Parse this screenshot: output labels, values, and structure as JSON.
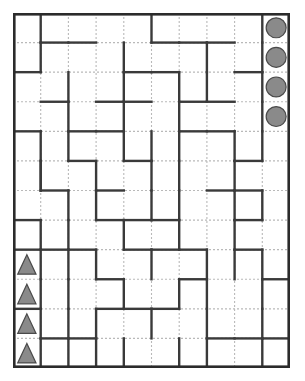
{
  "puzzle": {
    "type": "maze-grid",
    "title": "Grid Maze Puzzle",
    "grid": {
      "columns": 10,
      "rows": 12,
      "origin_x": 13,
      "origin_y": 13,
      "width": 277,
      "height": 355,
      "cell_width": 27.7,
      "cell_height": 29.583
    },
    "colors": {
      "background": "#ffffff",
      "wall": "#3a3a3a",
      "gridline": "#b9b9b9",
      "border": "#2b2b2b",
      "token_fill": "#8a8a8a",
      "token_stroke": "#4a4a4a"
    },
    "style": {
      "wall_width": 2.4,
      "border_width": 2.6,
      "gridline_width": 1.1,
      "gridline_dash": "2,2"
    },
    "tokens": [
      {
        "name": "circle-token-1",
        "shape": "circle",
        "col": 10,
        "row": 1
      },
      {
        "name": "circle-token-2",
        "shape": "circle",
        "col": 10,
        "row": 2
      },
      {
        "name": "circle-token-3",
        "shape": "circle",
        "col": 10,
        "row": 3
      },
      {
        "name": "circle-token-4",
        "shape": "circle",
        "col": 10,
        "row": 4
      },
      {
        "name": "triangle-token-1",
        "shape": "triangle",
        "col": 1,
        "row": 9
      },
      {
        "name": "triangle-token-2",
        "shape": "triangle",
        "col": 1,
        "row": 10
      },
      {
        "name": "triangle-token-3",
        "shape": "triangle",
        "col": 1,
        "row": 11
      },
      {
        "name": "triangle-token-4",
        "shape": "triangle",
        "col": 1,
        "row": 12
      }
    ],
    "walls_vertical": [
      [
        1,
        1
      ],
      [
        9,
        1
      ],
      [
        5,
        1
      ],
      [
        1,
        2
      ],
      [
        4,
        2
      ],
      [
        7,
        2
      ],
      [
        9,
        2
      ],
      [
        2,
        3
      ],
      [
        4,
        3
      ],
      [
        6,
        3
      ],
      [
        7,
        3
      ],
      [
        9,
        3
      ],
      [
        2,
        4
      ],
      [
        4,
        4
      ],
      [
        6,
        4
      ],
      [
        9,
        4
      ],
      [
        1,
        5
      ],
      [
        2,
        5
      ],
      [
        4,
        5
      ],
      [
        5,
        5
      ],
      [
        6,
        5
      ],
      [
        8,
        5
      ],
      [
        9,
        5
      ],
      [
        1,
        6
      ],
      [
        3,
        6
      ],
      [
        5,
        6
      ],
      [
        6,
        6
      ],
      [
        8,
        6
      ],
      [
        1,
        6
      ],
      [
        2,
        7
      ],
      [
        3,
        7
      ],
      [
        5,
        7
      ],
      [
        6,
        7
      ],
      [
        8,
        7
      ],
      [
        9,
        7
      ],
      [
        1,
        8
      ],
      [
        2,
        8
      ],
      [
        4,
        8
      ],
      [
        6,
        8
      ],
      [
        8,
        8
      ],
      [
        1,
        9
      ],
      [
        2,
        9
      ],
      [
        3,
        9
      ],
      [
        5,
        9
      ],
      [
        7,
        9
      ],
      [
        8,
        9
      ],
      [
        9,
        9
      ],
      [
        1,
        10
      ],
      [
        2,
        10
      ],
      [
        4,
        10
      ],
      [
        6,
        10
      ],
      [
        7,
        10
      ],
      [
        9,
        10
      ],
      [
        1,
        11
      ],
      [
        2,
        11
      ],
      [
        3,
        11
      ],
      [
        5,
        11
      ],
      [
        7,
        11
      ],
      [
        9,
        11
      ],
      [
        1,
        12
      ],
      [
        2,
        12
      ],
      [
        3,
        12
      ],
      [
        4,
        12
      ],
      [
        6,
        12
      ],
      [
        7,
        12
      ],
      [
        9,
        12
      ]
    ],
    "walls_horizontal": [
      [
        2,
        1
      ],
      [
        3,
        1
      ],
      [
        6,
        1
      ],
      [
        7,
        1
      ],
      [
        8,
        1
      ],
      [
        1,
        2
      ],
      [
        5,
        2
      ],
      [
        6,
        2
      ],
      [
        9,
        2
      ],
      [
        2,
        3
      ],
      [
        4,
        3
      ],
      [
        5,
        3
      ],
      [
        7,
        3
      ],
      [
        8,
        3
      ],
      [
        1,
        4
      ],
      [
        3,
        4
      ],
      [
        4,
        4
      ],
      [
        7,
        4
      ],
      [
        8,
        4
      ],
      [
        3,
        5
      ],
      [
        5,
        5
      ],
      [
        9,
        5
      ],
      [
        2,
        6
      ],
      [
        4,
        6
      ],
      [
        8,
        6
      ],
      [
        9,
        6
      ],
      [
        1,
        7
      ],
      [
        4,
        7
      ],
      [
        5,
        7
      ],
      [
        6,
        7
      ],
      [
        9,
        7
      ],
      [
        1,
        8
      ],
      [
        2,
        8
      ],
      [
        3,
        8
      ],
      [
        5,
        8
      ],
      [
        6,
        8
      ],
      [
        7,
        8
      ],
      [
        9,
        8
      ],
      [
        4,
        9
      ],
      [
        7,
        9
      ],
      [
        10,
        9
      ],
      [
        1,
        10
      ],
      [
        4,
        10
      ],
      [
        5,
        10
      ],
      [
        6,
        10
      ],
      [
        2,
        11
      ],
      [
        3,
        11
      ],
      [
        8,
        11
      ],
      [
        9,
        11
      ],
      [
        10,
        11
      ]
    ]
  }
}
